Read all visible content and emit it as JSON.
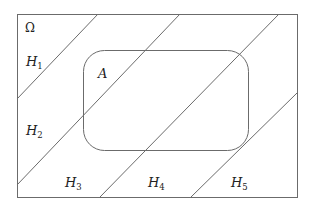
{
  "diagram": {
    "colors": {
      "stroke": "#6b6b6b",
      "text": "#222222",
      "background": "#ffffff"
    },
    "universe": {
      "label": "Ω",
      "x": 17,
      "y": 14,
      "width": 280,
      "height": 183
    },
    "event": {
      "label": "A",
      "x": 83,
      "y": 50,
      "width": 165,
      "height": 100,
      "radius": 21
    },
    "partition_lines": [
      {
        "x1": 98,
        "y1": 14,
        "x2": 17,
        "y2": 99
      },
      {
        "x1": 180,
        "y1": 14,
        "x2": 17,
        "y2": 185
      },
      {
        "x1": 279,
        "y1": 14,
        "x2": 100,
        "y2": 197
      },
      {
        "x1": 297,
        "y1": 93,
        "x2": 191,
        "y2": 197
      }
    ],
    "regions": [
      {
        "base": "H",
        "sub": "1",
        "x": 26,
        "y": 66
      },
      {
        "base": "H",
        "sub": "2",
        "x": 26,
        "y": 135
      },
      {
        "base": "H",
        "sub": "3",
        "x": 65,
        "y": 187
      },
      {
        "base": "H",
        "sub": "4",
        "x": 148,
        "y": 187
      },
      {
        "base": "H",
        "sub": "5",
        "x": 231,
        "y": 187
      }
    ]
  }
}
